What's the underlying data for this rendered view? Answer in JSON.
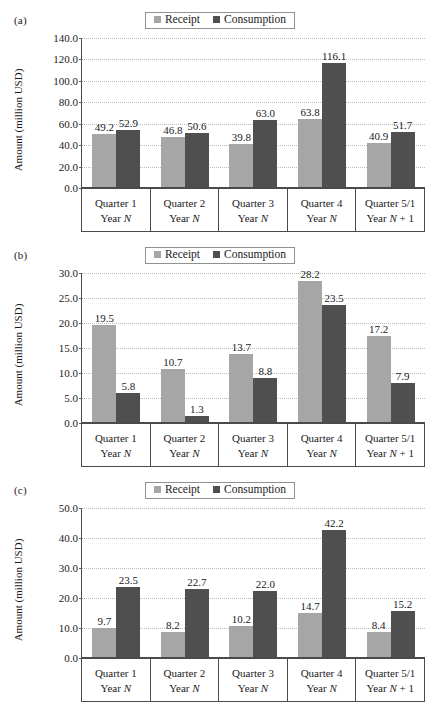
{
  "figure": {
    "panels": [
      "(a)",
      "(b)",
      "(c)"
    ],
    "legend": {
      "receipt_label": "Receipt",
      "consumption_label": "Consumption",
      "receipt_color": "#a6a6a6",
      "consumption_color": "#4f4f4f"
    },
    "ylabel": "Amount (million USD)",
    "categories_line1": [
      "Quarter 1",
      "Quarter 2",
      "Quarter 3",
      "Quarter 4",
      "Quarter 5/1"
    ],
    "categories_line2_prefix": [
      "Year ",
      "Year ",
      "Year ",
      "Year ",
      "Year "
    ],
    "categories_line2_italic": [
      "N",
      "N",
      "N",
      "N",
      "N"
    ],
    "categories_line2_suffix": [
      "",
      "",
      "",
      "",
      " + 1"
    ]
  },
  "chart_data": [
    {
      "type": "bar",
      "panel": "(a)",
      "title": "",
      "xlabel": "",
      "ylabel": "Amount (million USD)",
      "ylim": [
        0.0,
        140.0
      ],
      "ytick_step": 20.0,
      "yticks": [
        "0.0",
        "20.0",
        "40.0",
        "60.0",
        "80.0",
        "100.0",
        "120.0",
        "140.0"
      ],
      "grid": true,
      "legend_position": "top-center",
      "categories": [
        "Quarter 1 Year N",
        "Quarter 2 Year N",
        "Quarter 3 Year N",
        "Quarter 4 Year N",
        "Quarter 5/1 Year N + 1"
      ],
      "series": [
        {
          "name": "Receipt",
          "values": [
            49.2,
            46.8,
            39.8,
            63.8,
            40.9
          ],
          "labels": [
            "49.2",
            "46.8",
            "39.8",
            "63.8",
            "40.9"
          ]
        },
        {
          "name": "Consumption",
          "values": [
            52.9,
            50.6,
            63.0,
            116.1,
            51.7
          ],
          "labels": [
            "52.9",
            "50.6",
            "63.0",
            "116.1",
            "51.7"
          ]
        }
      ]
    },
    {
      "type": "bar",
      "panel": "(b)",
      "title": "",
      "xlabel": "",
      "ylabel": "Amount (million USD)",
      "ylim": [
        0.0,
        30.0
      ],
      "ytick_step": 5.0,
      "yticks": [
        "0.0",
        "5.0",
        "10.0",
        "15.0",
        "20.0",
        "25.0",
        "30.0"
      ],
      "grid": true,
      "legend_position": "top-center",
      "categories": [
        "Quarter 1 Year N",
        "Quarter 2 Year N",
        "Quarter 3 Year N",
        "Quarter 4 Year N",
        "Quarter 5/1 Year N + 1"
      ],
      "series": [
        {
          "name": "Receipt",
          "values": [
            19.5,
            10.7,
            13.7,
            28.2,
            17.2
          ],
          "labels": [
            "19.5",
            "10.7",
            "13.7",
            "28.2",
            "17.2"
          ]
        },
        {
          "name": "Consumption",
          "values": [
            5.8,
            1.3,
            8.8,
            23.5,
            7.9
          ],
          "labels": [
            "5.8",
            "1.3",
            "8.8",
            "23.5",
            "7.9"
          ]
        }
      ]
    },
    {
      "type": "bar",
      "panel": "(c)",
      "title": "",
      "xlabel": "",
      "ylabel": "Amount (million USD)",
      "ylim": [
        0.0,
        50.0
      ],
      "ytick_step": 10.0,
      "yticks": [
        "0.0",
        "10.0",
        "20.0",
        "30.0",
        "40.0",
        "50.0"
      ],
      "grid": true,
      "legend_position": "top-center",
      "categories": [
        "Quarter 1 Year N",
        "Quarter 2 Year N",
        "Quarter 3 Year N",
        "Quarter 4 Year N",
        "Quarter 5/1 Year N + 1"
      ],
      "series": [
        {
          "name": "Receipt",
          "values": [
            9.7,
            8.2,
            10.2,
            14.7,
            8.4
          ],
          "labels": [
            "9.7",
            "8.2",
            "10.2",
            "14.7",
            "8.4"
          ]
        },
        {
          "name": "Consumption",
          "values": [
            23.5,
            22.7,
            22.0,
            42.2,
            15.2
          ],
          "labels": [
            "23.5",
            "22.7",
            "22.0",
            "42.2",
            "15.2"
          ]
        }
      ]
    }
  ]
}
